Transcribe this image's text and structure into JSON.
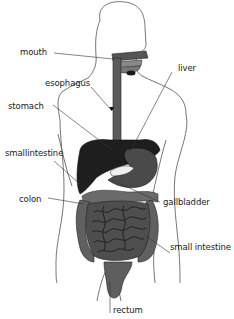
{
  "diagram": {
    "colors": {
      "outline": "#555555",
      "dark_organ": "#1e1e1e",
      "mid_organ": "#4a4a4a",
      "intestine": "#5a5a5a",
      "intestine_line": "#222222",
      "label_text": "#222222",
      "leader_line": "#333333"
    },
    "labels": {
      "mouth": "mouth",
      "esophagus": "esophagus",
      "liver": "liver",
      "stomach": "stomach",
      "small_intestine_left": "smallintestine",
      "gallbladder": "gallbladder",
      "colon": "colon",
      "small_intestine_right": "small intestine",
      "rectum": "rectum"
    }
  }
}
